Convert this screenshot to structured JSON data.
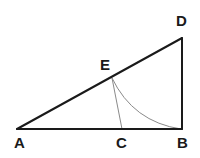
{
  "figure": {
    "background_color": "#ffffff",
    "stroke_color": "#1a1a1a",
    "accent_stroke_color": "#8a8a8a",
    "points": {
      "A": {
        "label": "A",
        "x": 17,
        "y": 129,
        "label_x": 14,
        "label_y": 148
      },
      "B": {
        "label": "B",
        "x": 182,
        "y": 129,
        "label_x": 177,
        "label_y": 148
      },
      "C": {
        "label": "C",
        "x": 122,
        "y": 129,
        "label_x": 116,
        "label_y": 148
      },
      "D": {
        "label": "D",
        "x": 182,
        "y": 38,
        "label_x": 176,
        "label_y": 26
      },
      "E": {
        "label": "E",
        "x": 112,
        "y": 78,
        "label_x": 100,
        "label_y": 70
      }
    },
    "segments": {
      "base_AB": "M 17 129 L 182 129",
      "hypotenuse_AD": "M 17 129 L 182 38",
      "vertical_DB": "M 182 38 L 182 129",
      "cevian_EC": "M 112 78 L 122 129",
      "arc_EB": "M 112 78 Q 133 122 181 129"
    },
    "stroke_widths": {
      "triangle": 2,
      "cevian": 1,
      "arc": 1
    }
  }
}
